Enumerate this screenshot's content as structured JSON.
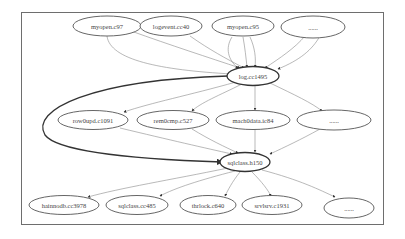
{
  "diagram": {
    "type": "call-graph",
    "nodes": {
      "n1": {
        "label": "myopen.c97"
      },
      "n2": {
        "label": "logevent.cc40"
      },
      "n3": {
        "label": "myopen.c95"
      },
      "n4": {
        "label": "......"
      },
      "center1": {
        "label": "log.cc1495"
      },
      "m1": {
        "label": "row0upd.c1091"
      },
      "m2": {
        "label": "rem0cmp.c527"
      },
      "m3": {
        "label": "mach0data.ic84"
      },
      "m4": {
        "label": "......"
      },
      "center2": {
        "label": "sqlclass.h150"
      },
      "b1": {
        "label": "hainnodb.cc3978"
      },
      "b2": {
        "label": "sqlclass.cc485"
      },
      "b3": {
        "label": "thrlock.c640"
      },
      "b4": {
        "label": "srvlsrv.c1931"
      },
      "b5": {
        "label": "......"
      }
    },
    "edges": [
      {
        "from": "n1",
        "to": "center1"
      },
      {
        "from": "n2",
        "to": "center1"
      },
      {
        "from": "n3",
        "to": "center1",
        "count": 3
      },
      {
        "from": "n4",
        "to": "center1",
        "count": 2
      },
      {
        "from": "center1",
        "to": "m1"
      },
      {
        "from": "center1",
        "to": "m2"
      },
      {
        "from": "center1",
        "to": "m3"
      },
      {
        "from": "center1",
        "to": "m4"
      },
      {
        "from": "center1",
        "to": "center2",
        "style": "bold"
      },
      {
        "from": "m1",
        "to": "center2"
      },
      {
        "from": "m2",
        "to": "center2"
      },
      {
        "from": "m3",
        "to": "center2"
      },
      {
        "from": "m4",
        "to": "center2"
      },
      {
        "from": "center2",
        "to": "b1"
      },
      {
        "from": "center2",
        "to": "b2"
      },
      {
        "from": "center2",
        "to": "b3"
      },
      {
        "from": "center2",
        "to": "b4"
      },
      {
        "from": "center2",
        "to": "b5"
      }
    ],
    "colors": {
      "stroke": "#555555",
      "edge": "#777777",
      "frame": "#6e6e6e",
      "text": "#444444"
    }
  }
}
